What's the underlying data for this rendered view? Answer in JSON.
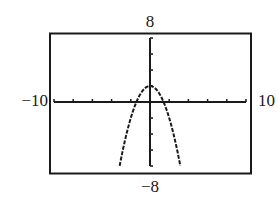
{
  "window_labels": {
    "ymax": "8",
    "ymin": "−8",
    "xmin": "−10",
    "xmax": "10"
  },
  "chart_data": {
    "type": "line",
    "title": "",
    "xlabel": "",
    "ylabel": "",
    "xlim": [
      -10,
      10
    ],
    "ylim": [
      -8,
      8
    ],
    "xscl": 2,
    "yscl": 2,
    "grid": false,
    "frame": true,
    "tick_labels": {
      "x": [
        "−10",
        "10"
      ],
      "y": [
        "−8",
        "8"
      ]
    },
    "function": "y = 2 - x^2",
    "series": [
      {
        "name": "y = 2 − x²",
        "style": "dotted-pixel",
        "x": [
          -3.16,
          -3.0,
          -2.5,
          -2.0,
          -1.5,
          -1.414,
          -1.0,
          -0.5,
          0,
          0.5,
          1.0,
          1.414,
          1.5,
          2.0,
          2.5,
          3.0,
          3.16
        ],
        "y": [
          -8.0,
          -7.0,
          -4.25,
          -2.0,
          -0.25,
          0,
          1.0,
          1.75,
          2.0,
          1.75,
          1.0,
          0,
          -0.25,
          -2.0,
          -4.25,
          -7.0,
          -8.0
        ]
      }
    ],
    "annotations": {
      "vertex": [
        0,
        2
      ],
      "x_intercepts": [
        -1.414,
        1.414
      ]
    }
  }
}
